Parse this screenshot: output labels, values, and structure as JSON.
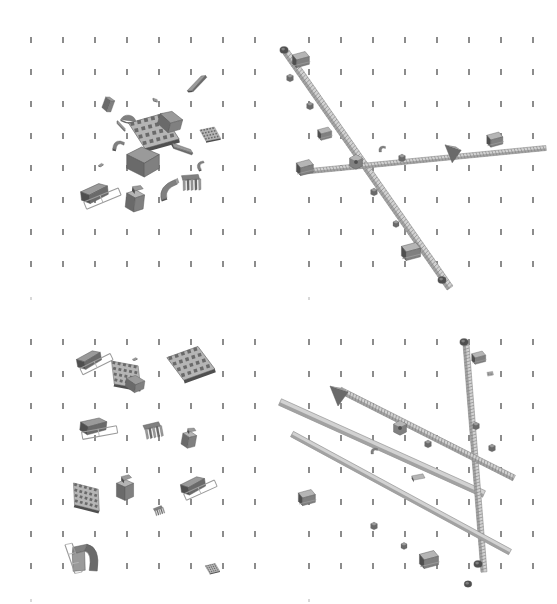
{
  "view": {
    "title": "CAD assembly multi-view render",
    "background_color": "#ffffff",
    "width": 557,
    "height": 604,
    "panel_layout": "2x2",
    "render_style": "grayscale shaded solid"
  },
  "grid": {
    "tick_color": "#8c8c8c",
    "tick_width_px": 2,
    "tick_height_px": 6,
    "spacing_x_px": 32,
    "spacing_y_px": 32,
    "origin_x_px": 30,
    "origin_y_px": 37,
    "cols": 8,
    "rows": 8,
    "faint_marker_color": "#d8d8d8"
  },
  "palette": {
    "shade_darkest": "#4f4f4f",
    "shade_dark": "#6a6a6a",
    "shade_mid": "#808080",
    "shade_light": "#9a9a9a",
    "shade_lighter": "#b5b5b5",
    "shade_pale": "#d2d2d2",
    "edge_line": "#5a5a5a",
    "highlight": "#efefef"
  },
  "panels": [
    {
      "id": "panel-top-left",
      "name": "exploded-parts-cluster-centered",
      "position": {
        "x": 0,
        "y": 0,
        "w": 279,
        "h": 302
      },
      "content_type": "scattered-parts",
      "part_count": 17,
      "cluster_center": {
        "x": 140,
        "y": 155
      },
      "description": "Loose mechanical parts gathered near panel center"
    },
    {
      "id": "panel-top-right",
      "name": "assembled-rod-structure-diagonal",
      "position": {
        "x": 278,
        "y": 0,
        "w": 279,
        "h": 302
      },
      "content_type": "assembled-rods",
      "rod_count": 2,
      "description": "Long threaded rod running upper-left to lower-right crossed by a near-horizontal rod"
    },
    {
      "id": "panel-bottom-left",
      "name": "exploded-parts-grid-spread",
      "position": {
        "x": 0,
        "y": 302,
        "w": 279,
        "h": 302
      },
      "content_type": "scattered-parts",
      "part_count": 14,
      "description": "Parts distributed evenly across the panel in loose rows"
    },
    {
      "id": "panel-bottom-right",
      "name": "assembled-rod-structure-crossed",
      "position": {
        "x": 278,
        "y": 302,
        "w": 279,
        "h": 302
      },
      "content_type": "assembled-rods",
      "rod_count": 4,
      "description": "Three crossing threaded rods with brackets and end caps"
    }
  ],
  "parts_top_left": [
    {
      "name": "angled-block-small",
      "x": 97,
      "y": 92,
      "rot": 20,
      "scale": 0.62,
      "shape": "wedge"
    },
    {
      "name": "rod-segment-thin",
      "x": 180,
      "y": 78,
      "rot": -38,
      "scale": 0.75,
      "shape": "bar"
    },
    {
      "name": "dome-cap",
      "x": 117,
      "y": 107,
      "rot": 8,
      "scale": 0.78,
      "shape": "dome"
    },
    {
      "name": "lattice-plate-large",
      "x": 135,
      "y": 118,
      "rot": -12,
      "scale": 1.18,
      "shape": "lattice"
    },
    {
      "name": "block-corner",
      "x": 155,
      "y": 108,
      "rot": 15,
      "scale": 0.9,
      "shape": "cube"
    },
    {
      "name": "small-lattice-tab",
      "x": 190,
      "y": 120,
      "rot": -8,
      "scale": 0.5,
      "shape": "lattice"
    },
    {
      "name": "bar-angled",
      "x": 165,
      "y": 143,
      "rot": 28,
      "scale": 0.72,
      "shape": "bar"
    },
    {
      "name": "curved-hook",
      "x": 108,
      "y": 135,
      "rot": 10,
      "scale": 0.7,
      "shape": "hook"
    },
    {
      "name": "main-cube-body",
      "x": 128,
      "y": 148,
      "rot": 0,
      "scale": 1.25,
      "shape": "cube"
    },
    {
      "name": "curved-shell",
      "x": 154,
      "y": 178,
      "rot": -20,
      "scale": 0.85,
      "shape": "arc"
    },
    {
      "name": "comb-bracket",
      "x": 178,
      "y": 172,
      "rot": 5,
      "scale": 0.92,
      "shape": "comb"
    },
    {
      "name": "frame-rail-assembly",
      "x": 78,
      "y": 180,
      "rot": -6,
      "scale": 1.05,
      "shape": "frame"
    },
    {
      "name": "stepped-block",
      "x": 122,
      "y": 185,
      "rot": 6,
      "scale": 1.0,
      "shape": "stepblock"
    },
    {
      "name": "flat-chip",
      "x": 94,
      "y": 160,
      "rot": -15,
      "scale": 0.45,
      "shape": "chip"
    },
    {
      "name": "thin-plate",
      "x": 148,
      "y": 95,
      "rot": 40,
      "scale": 0.5,
      "shape": "chip"
    },
    {
      "name": "bracket-small",
      "x": 190,
      "y": 155,
      "rot": -25,
      "scale": 0.55,
      "shape": "hook"
    },
    {
      "name": "pin-cylinder",
      "x": 104,
      "y": 120,
      "rot": 55,
      "scale": 0.4,
      "shape": "bar"
    }
  ],
  "parts_bottom_left": [
    {
      "name": "frame-rail-assembly-a",
      "x": 72,
      "y": 44,
      "rot": -10,
      "scale": 0.95,
      "shape": "frame"
    },
    {
      "name": "lattice-plate-a",
      "x": 106,
      "y": 60,
      "rot": 14,
      "scale": 0.9,
      "shape": "lattice"
    },
    {
      "name": "small-chip-a",
      "x": 128,
      "y": 52,
      "rot": -6,
      "scale": 0.42,
      "shape": "chip"
    },
    {
      "name": "block-wedge-a",
      "x": 120,
      "y": 68,
      "rot": 8,
      "scale": 0.72,
      "shape": "cube"
    },
    {
      "name": "lattice-plate-b",
      "x": 172,
      "y": 48,
      "rot": -16,
      "scale": 1.1,
      "shape": "lattice"
    },
    {
      "name": "frame-rail-assembly-b",
      "x": 76,
      "y": 112,
      "rot": 6,
      "scale": 1.0,
      "shape": "frame"
    },
    {
      "name": "comb-bracket-a",
      "x": 140,
      "y": 118,
      "rot": -4,
      "scale": 0.88,
      "shape": "comb"
    },
    {
      "name": "stepped-block-a",
      "x": 176,
      "y": 122,
      "rot": 10,
      "scale": 0.78,
      "shape": "stepblock"
    },
    {
      "name": "lattice-plate-c",
      "x": 66,
      "y": 182,
      "rot": 18,
      "scale": 0.85,
      "shape": "lattice"
    },
    {
      "name": "block-tower",
      "x": 112,
      "y": 172,
      "rot": 0,
      "scale": 0.95,
      "shape": "stepblock"
    },
    {
      "name": "comb-small",
      "x": 146,
      "y": 198,
      "rot": -12,
      "scale": 0.48,
      "shape": "comb"
    },
    {
      "name": "frame-rail-assembly-c",
      "x": 176,
      "y": 170,
      "rot": -8,
      "scale": 0.95,
      "shape": "frame"
    },
    {
      "name": "arc-shell-rail",
      "x": 62,
      "y": 238,
      "rot": 4,
      "scale": 1.0,
      "shape": "archrail"
    },
    {
      "name": "tiny-lattice",
      "x": 192,
      "y": 252,
      "rot": -10,
      "scale": 0.35,
      "shape": "lattice"
    }
  ],
  "rods_top_right": [
    {
      "name": "rod-main-diagonal",
      "x1": 8,
      "y1": 52,
      "x2": 172,
      "y2": 288,
      "thickness": 7,
      "threaded": true
    },
    {
      "name": "rod-horizontal",
      "x1": 22,
      "y1": 172,
      "x2": 268,
      "y2": 148,
      "thickness": 5,
      "threaded": true
    }
  ],
  "fittings_top_right": [
    {
      "name": "end-cap-top",
      "x": 6,
      "y": 50,
      "scale": 0.6
    },
    {
      "name": "bracket-upper",
      "x": 22,
      "y": 60,
      "scale": 0.85
    },
    {
      "name": "nut-collar-a",
      "x": 12,
      "y": 78,
      "scale": 0.55
    },
    {
      "name": "nut-collar-b",
      "x": 32,
      "y": 106,
      "scale": 0.55
    },
    {
      "name": "clamp-mid",
      "x": 46,
      "y": 134,
      "scale": 0.7
    },
    {
      "name": "junction-hub",
      "x": 78,
      "y": 162,
      "scale": 0.8
    },
    {
      "name": "nut-collar-c",
      "x": 96,
      "y": 192,
      "scale": 0.55
    },
    {
      "name": "nut-collar-d",
      "x": 118,
      "y": 224,
      "scale": 0.5
    },
    {
      "name": "bracket-lower",
      "x": 132,
      "y": 252,
      "scale": 0.95
    },
    {
      "name": "end-cap-bottom",
      "x": 164,
      "y": 280,
      "scale": 0.6
    },
    {
      "name": "bracket-left-arm",
      "x": 26,
      "y": 168,
      "scale": 0.85
    },
    {
      "name": "collar-mid-bar",
      "x": 124,
      "y": 158,
      "scale": 0.55
    },
    {
      "name": "wedge-right",
      "x": 176,
      "y": 152,
      "scale": 0.9
    },
    {
      "name": "bracket-right-end",
      "x": 216,
      "y": 140,
      "scale": 0.8
    },
    {
      "name": "hook-small-mid",
      "x": 104,
      "y": 148,
      "scale": 0.5
    }
  ],
  "rods_bottom_right": [
    {
      "name": "rod-long-diagonal",
      "x1": 2,
      "y1": 100,
      "x2": 206,
      "y2": 192,
      "thickness": 7,
      "threaded": false
    },
    {
      "name": "rod-upper-diagonal",
      "x1": 188,
      "y1": 42,
      "x2": 206,
      "y2": 270,
      "thickness": 6,
      "threaded": true
    },
    {
      "name": "rod-cross-a",
      "x1": 62,
      "y1": 88,
      "x2": 236,
      "y2": 176,
      "thickness": 6,
      "threaded": true
    },
    {
      "name": "rod-cross-b",
      "x1": 14,
      "y1": 132,
      "x2": 232,
      "y2": 250,
      "thickness": 6,
      "threaded": false
    }
  ],
  "fittings_bottom_right": [
    {
      "name": "arrow-wedge-left",
      "x": 62,
      "y": 92,
      "scale": 1.0
    },
    {
      "name": "hub-center",
      "x": 122,
      "y": 126,
      "scale": 0.8
    },
    {
      "name": "nut-collar-e",
      "x": 150,
      "y": 142,
      "scale": 0.55
    },
    {
      "name": "end-cap-top-right",
      "x": 186,
      "y": 40,
      "scale": 0.6
    },
    {
      "name": "bracket-right-upper",
      "x": 200,
      "y": 56,
      "scale": 0.7
    },
    {
      "name": "lattice-tab-right",
      "x": 212,
      "y": 72,
      "scale": 0.45
    },
    {
      "name": "collar-right-a",
      "x": 198,
      "y": 124,
      "scale": 0.55
    },
    {
      "name": "collar-right-b",
      "x": 214,
      "y": 146,
      "scale": 0.55
    },
    {
      "name": "end-cap-bottom-right",
      "x": 200,
      "y": 262,
      "scale": 0.6
    },
    {
      "name": "bracket-left-low",
      "x": 28,
      "y": 196,
      "scale": 0.85
    },
    {
      "name": "nut-collar-f",
      "x": 96,
      "y": 224,
      "scale": 0.55
    },
    {
      "name": "nut-collar-g",
      "x": 126,
      "y": 244,
      "scale": 0.5
    },
    {
      "name": "bracket-bottom-mid",
      "x": 150,
      "y": 258,
      "scale": 0.95
    },
    {
      "name": "end-cap-far-right",
      "x": 190,
      "y": 282,
      "scale": 0.55
    },
    {
      "name": "hook-center-small",
      "x": 96,
      "y": 148,
      "scale": 0.5
    },
    {
      "name": "plate-flat-mid",
      "x": 140,
      "y": 176,
      "scale": 0.7
    }
  ]
}
